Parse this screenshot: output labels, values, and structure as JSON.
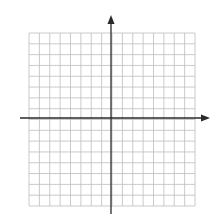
{
  "diagram": {
    "type": "coordinate-plane",
    "grid": {
      "columns": 16,
      "rows": 16,
      "left": 29,
      "top": 33,
      "right": 195,
      "bottom": 206,
      "line_color": "#bdbdbd",
      "line_width": 0.8
    },
    "axes": {
      "color": "#2a2a2a",
      "width": 1.3,
      "origin": {
        "x": 111,
        "y": 118
      },
      "x_axis": {
        "start": 20,
        "end": 210,
        "arrow": "right"
      },
      "y_axis": {
        "start": 214,
        "end": 15,
        "arrow": "up"
      }
    },
    "background": "#ffffff"
  }
}
